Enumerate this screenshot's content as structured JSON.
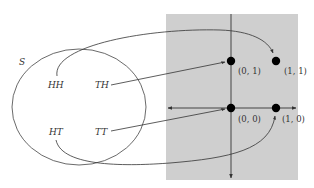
{
  "diagram": {
    "set_label": "S",
    "outcomes": [
      {
        "label": "HH",
        "maps_to": "(1, 1)"
      },
      {
        "label": "TH",
        "maps_to": "(0, 1)"
      },
      {
        "label": "HT",
        "maps_to": "(1, 0)"
      },
      {
        "label": "TT",
        "maps_to": "(0, 0)"
      }
    ],
    "points": [
      {
        "label": "(0, 1)"
      },
      {
        "label": "(1, 1)"
      },
      {
        "label": "(0, 0)"
      },
      {
        "label": "(1, 0)"
      }
    ],
    "colors": {
      "plane_background": "#cfcfcf",
      "stroke": "#333333",
      "point_fill": "#000000"
    }
  }
}
